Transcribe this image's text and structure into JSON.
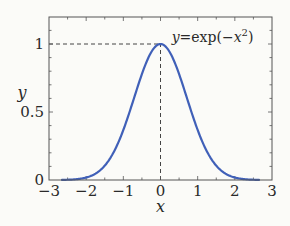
{
  "chart_data": {
    "type": "line",
    "title": "",
    "xlabel": "x",
    "ylabel": "y",
    "xlim": [
      -3,
      3
    ],
    "ylim": [
      0,
      1.15
    ],
    "xticks": [
      -3,
      -2,
      -1,
      0,
      1,
      2,
      3
    ],
    "xtick_labels": [
      "−3",
      "−2",
      "−1",
      "0",
      "1",
      "2",
      "3"
    ],
    "yticks": [
      0,
      0.5,
      1
    ],
    "ytick_labels": [
      "0",
      "0.5",
      "1"
    ],
    "minor_tick_step_x": 0.5,
    "minor_tick_step_y": 0.1,
    "grid": false,
    "series": [
      {
        "name": "y=exp(-x^2)",
        "function": "exp(-x^2)",
        "x_range": [
          -2.65,
          2.65
        ],
        "color": "#4060b8"
      }
    ],
    "reference_lines": [
      {
        "type": "horizontal",
        "y": 1,
        "x_from": -3,
        "x_to": 0,
        "style": "dashed"
      },
      {
        "type": "vertical",
        "x": 0,
        "y_from": 0,
        "y_to": 1,
        "style": "dashed"
      }
    ],
    "annotation": {
      "text_prefix": "y",
      "text_eq": "=exp(−",
      "text_var": "x",
      "text_sup": "2",
      "text_suffix": ")",
      "at": {
        "x": 0.3,
        "y": 1.03
      }
    },
    "colors": {
      "axis": "#555555",
      "curve": "#4060b8",
      "text": "#2a2a2a",
      "background": "#fbfbf8"
    }
  }
}
